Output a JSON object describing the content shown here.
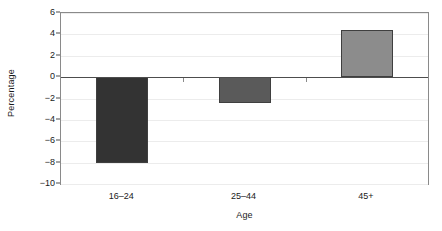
{
  "chart_data": {
    "type": "bar",
    "title": "",
    "subtitle": "",
    "xlabel": "Age",
    "ylabel": "Percentage",
    "categories": [
      "16–24",
      "25–44",
      "45+"
    ],
    "values": [
      -8.0,
      -2.4,
      4.4
    ],
    "series": [
      {
        "name": "Percentage change",
        "values": [
          -8.0,
          -2.4,
          4.4
        ]
      }
    ],
    "ylim": [
      -10,
      6
    ],
    "yticks": [
      6,
      4,
      2,
      0,
      -2,
      -4,
      -6,
      -8,
      -10
    ],
    "ytick_labels": [
      "6",
      "4",
      "2",
      "0",
      "−2",
      "−4",
      "−6",
      "−8",
      "−10"
    ],
    "grid": true,
    "grid_axis": "y",
    "legend": false,
    "legend_position": "none",
    "zero_line": true,
    "bar_colors": [
      "#333333",
      "#5a5a5a",
      "#8c8c8c"
    ],
    "bar_edge_color": "#3f3f3f",
    "grid_color": "#ececec",
    "axis_color": "#8a8a8a",
    "zero_line_color": "#4d4d4d",
    "background_color": "#ffffff",
    "text_color": "#1a1a1a"
  }
}
